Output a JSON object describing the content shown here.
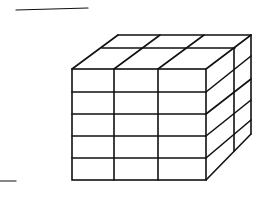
{
  "figure": {
    "dimensions": {
      "width": 3,
      "depth": 2,
      "height": 5
    },
    "stroke_color": "#111111",
    "background_color": "#ffffff"
  },
  "answer_lines": [
    {
      "name": "top-answer-line",
      "x1": 16,
      "y1": 10,
      "x2": 88,
      "y2": 8
    },
    {
      "name": "bottom-answer-line",
      "x1": 0,
      "y1": 181,
      "x2": 16,
      "y2": 181
    }
  ]
}
